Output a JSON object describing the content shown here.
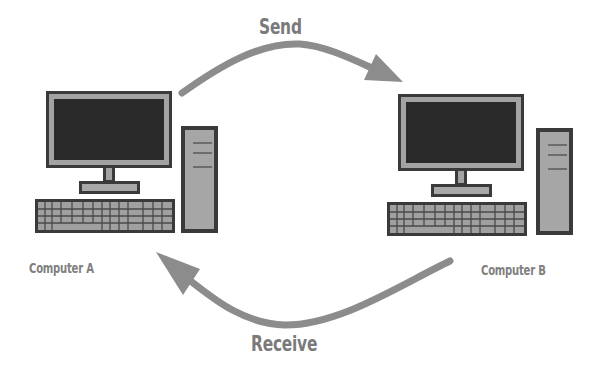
{
  "diagram": {
    "type": "network-communication",
    "nodes": [
      {
        "id": "a",
        "label": "Computer A",
        "icon": "desktop-computer-icon"
      },
      {
        "id": "b",
        "label": "Computer B",
        "icon": "desktop-computer-icon"
      }
    ],
    "edges": [
      {
        "from": "a",
        "to": "b",
        "label": "Send"
      },
      {
        "from": "b",
        "to": "a",
        "label": "Receive"
      }
    ]
  },
  "labels": {
    "send": "Send",
    "receive": "Receive",
    "computer_a": "Computer A",
    "computer_b": "Computer B"
  },
  "colors": {
    "arrow": "#8c8c8c",
    "label_text": "#7a7a7a",
    "outline": "#333333",
    "screen": "#2a2a2a",
    "frame": "#a3a3a3"
  }
}
